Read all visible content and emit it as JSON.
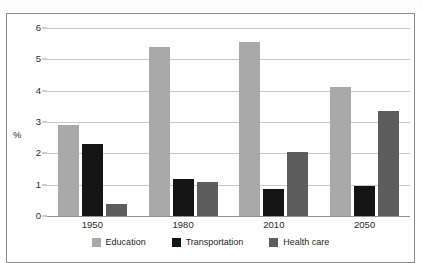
{
  "chart_data": {
    "type": "bar",
    "title": "",
    "xlabel": "",
    "ylabel": "%",
    "categories": [
      "1950",
      "1980",
      "2010",
      "2050"
    ],
    "series": [
      {
        "name": "Education",
        "color": "#a9a9a9",
        "values": [
          2.9,
          5.4,
          5.55,
          4.12
        ]
      },
      {
        "name": "Transportation",
        "color": "#141414",
        "values": [
          2.3,
          1.17,
          0.85,
          0.97
        ]
      },
      {
        "name": "Health care",
        "color": "#5d5d5d",
        "values": [
          0.38,
          1.1,
          2.03,
          3.35
        ]
      }
    ],
    "ylim": [
      0,
      6
    ],
    "yticks": [
      "0",
      "1",
      "2",
      "3",
      "4",
      "5",
      "6"
    ],
    "grid": true,
    "legend_position": "bottom"
  },
  "axis": {
    "y_title": "%",
    "tick_0": "0",
    "tick_1": "1",
    "tick_2": "2",
    "tick_3": "3",
    "tick_4": "4",
    "tick_5": "5",
    "tick_6": "6"
  },
  "xlabels": {
    "c0": "1950",
    "c1": "1980",
    "c2": "2010",
    "c3": "2050"
  },
  "legend": {
    "items": [
      {
        "label": "Education"
      },
      {
        "label": "Transportation"
      },
      {
        "label": "Health care"
      }
    ]
  }
}
